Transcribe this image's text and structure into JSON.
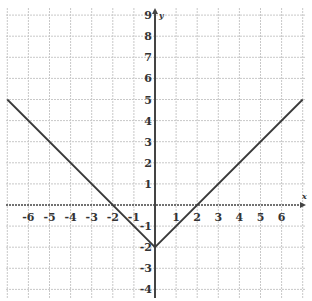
{
  "chart_data": {
    "type": "line",
    "title": "",
    "xlabel": "x",
    "ylabel": "y",
    "xlim": [
      -7,
      7
    ],
    "ylim": [
      -4,
      9
    ],
    "grid": true,
    "x_ticks": [
      -6,
      -5,
      -4,
      -3,
      -2,
      -1,
      1,
      2,
      3,
      4,
      5,
      6
    ],
    "y_ticks": [
      -4,
      -3,
      -2,
      -1,
      1,
      2,
      3,
      4,
      5,
      6,
      7,
      8,
      9
    ],
    "series": [
      {
        "name": "y = |x| - 2",
        "points": [
          [
            -7,
            5
          ],
          [
            0,
            -2
          ],
          [
            7,
            5
          ]
        ]
      }
    ],
    "annotations": []
  },
  "colors": {
    "grid": "#c8c8c8",
    "axis": "#444444",
    "line": "#3a3a3a"
  }
}
